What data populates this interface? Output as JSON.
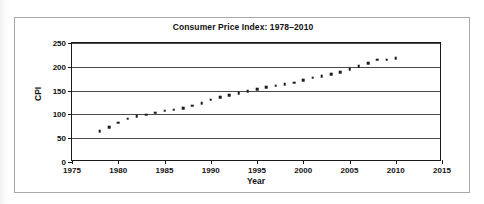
{
  "chart_data": {
    "type": "scatter",
    "title": "Consumer Price Index: 1978–2010",
    "xlabel": "Year",
    "ylabel": "CPI",
    "xlim": [
      1975,
      2015
    ],
    "ylim": [
      0,
      250
    ],
    "xticks": [
      1975,
      1980,
      1985,
      1990,
      1995,
      2000,
      2005,
      2010,
      2015
    ],
    "yticks": [
      0,
      50,
      100,
      150,
      200,
      250
    ],
    "grid": "horizontal",
    "legend": "none",
    "marker": "small filled square",
    "marker_color": "#1a1a1a",
    "x": [
      1978,
      1979,
      1980,
      1981,
      1982,
      1983,
      1984,
      1985,
      1986,
      1987,
      1988,
      1989,
      1990,
      1991,
      1992,
      1993,
      1994,
      1995,
      1996,
      1997,
      1998,
      1999,
      2000,
      2001,
      2002,
      2003,
      2004,
      2005,
      2006,
      2007,
      2008,
      2009,
      2010
    ],
    "y": [
      65.2,
      72.6,
      82.4,
      90.9,
      96.5,
      99.6,
      103.9,
      107.6,
      109.6,
      113.6,
      118.3,
      124.0,
      130.7,
      136.2,
      140.3,
      144.5,
      148.2,
      152.4,
      156.9,
      160.5,
      163.0,
      166.6,
      172.2,
      177.1,
      179.9,
      184.0,
      188.9,
      195.3,
      201.6,
      207.3,
      215.3,
      214.5,
      218.1
    ],
    "note_series_name": "Consumer Price Index"
  }
}
